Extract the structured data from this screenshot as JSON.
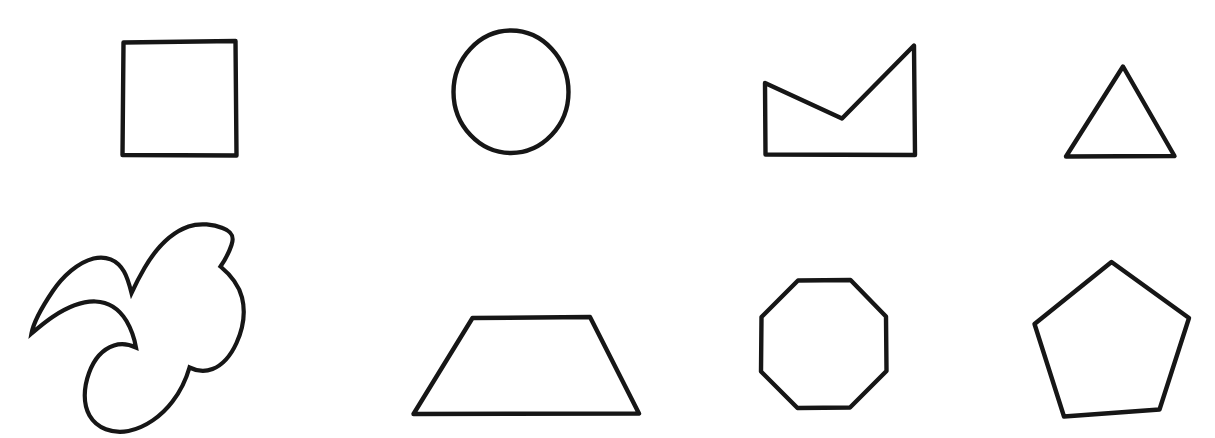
{
  "canvas": {
    "width": 1215,
    "height": 438,
    "background_color": "#ffffff",
    "stroke_color": "#161616",
    "fill_color": "#ffffff",
    "stroke_width": 4.4,
    "description": "Hand-drawn style line-art sheet of eight outlined geometric shapes arranged in two rows of four"
  },
  "rows": [
    {
      "name": "top-row",
      "shape_names": [
        "square",
        "circle",
        "arrow-polygon",
        "triangle"
      ]
    },
    {
      "name": "bottom-row",
      "shape_names": [
        "blob",
        "trapezoid",
        "octagon",
        "heptagon"
      ]
    }
  ],
  "shapes": [
    {
      "id": "square",
      "label": "Square",
      "sides": 4,
      "row": 1,
      "column": 1,
      "bbox": [
        121,
        40,
        116,
        117
      ],
      "path": "M123.5 42.5 L235.5 41.0 L236.5 155.5 L122.5 155.0 Z"
    },
    {
      "id": "circle",
      "label": "Circle",
      "sides": 0,
      "row": 1,
      "column": 2,
      "bbox": [
        452,
        28,
        118,
        127
      ],
      "path": "M511 30.5 C542.5 30.5 568.5 58.5 568.5 92.0 C568.5 125.5 542.5 153.0 511 153.0 C479.5 153.0 453.5 125.5 453.5 92.0 C453.5 58.5 479.5 30.5 511 30.5 Z"
    },
    {
      "id": "arrow-polygon",
      "label": "Arrow polygon",
      "sides": 5,
      "row": 1,
      "column": 3,
      "bbox": [
        763,
        44,
        152,
        113
      ],
      "path": "M765.0 83.0 L842.0 118.5 L914.0 45.5 L915.0 155.0 L765.5 154.5 Z"
    },
    {
      "id": "triangle",
      "label": "Triangle",
      "sides": 3,
      "row": 1,
      "column": 4,
      "bbox": [
        1065,
        65,
        111,
        93
      ],
      "path": "M1123.0 66.5 L1174.5 156.0 L1066.0 156.5 Z"
    },
    {
      "id": "blob",
      "label": "Blob",
      "sides": 0,
      "row": 2,
      "column": 1,
      "bbox": [
        31,
        222,
        215,
        205
      ],
      "path": "M222.5 228.0 C214.0 224.5 200.0 222.5 188.5 226.5 C170.0 233.0 155.0 250.0 144.5 268.0 C139.5 276.5 135.0 285.5 131.5 293.0 C129.5 285.0 127.5 277.5 124.0 271.5 C117.0 259.5 105.5 255.5 93.5 258.5 C78.0 262.5 63.0 276.0 52.5 291.5 C41.0 308.5 33.5 322.5 31.5 333.5 C38.0 328.0 45.0 322.0 52.5 317.0 C66.0 308.0 81.5 301.0 95.5 301.5 C109.5 302.0 119.5 309.5 126.5 321.0 C131.5 329.5 134.5 339.0 136.0 347.5 C129.5 344.5 121.5 343.0 114.0 345.5 C102.0 349.5 93.5 360.5 89.0 373.0 C83.5 388.0 83.0 404.0 89.5 415.5 C97.0 428.5 112.5 434.0 128.5 431.0 C145.5 427.5 161.5 416.0 172.5 401.5 C181.0 390.5 186.5 378.0 189.5 367.5 C196.5 371.0 205.0 372.0 212.5 369.0 C223.0 365.0 231.0 355.0 236.5 343.0 C243.0 328.5 245.5 311.5 242.0 297.5 C238.5 283.5 229.5 274.0 220.5 266.5 C225.0 260.0 229.0 252.5 231.5 245.0 C234.5 236.5 232.0 231.5 222.5 228.0 Z"
    },
    {
      "id": "trapezoid",
      "label": "Trapezoid",
      "sides": 4,
      "row": 2,
      "column": 2,
      "bbox": [
        412,
        316,
        228,
        99
      ],
      "path": "M472.5 318.0 L590.0 317.0 L639.0 413.5 L413.5 414.0 Z"
    },
    {
      "id": "octagon",
      "label": "Octagon",
      "sides": 8,
      "row": 2,
      "column": 3,
      "bbox": [
        759,
        278,
        130,
        132
      ],
      "path": "M798.0 280.5 L850.5 280.0 L886.0 316.5 L886.5 371.0 L850.0 407.5 L797.5 408.0 L761.0 371.5 L761.5 317.0 Z"
    },
    {
      "id": "heptagon",
      "label": "Heptagon",
      "sides": 7,
      "row": 2,
      "column": 4,
      "bbox": [
        1033,
        260,
        159,
        158
      ],
      "path": "M1111.5 262.0 L1189.0 318.0 L1159.5 409.5 L1064.0 416.5 L1034.5 324.0 Z"
    }
  ],
  "heptagon_vertices": [
    [
      1111,
      262
    ],
    [
      1176,
      298
    ],
    [
      1189,
      371
    ],
    [
      1144,
      416
    ],
    [
      1070,
      414
    ],
    [
      1035,
      348
    ],
    [
      1050,
      285
    ]
  ]
}
